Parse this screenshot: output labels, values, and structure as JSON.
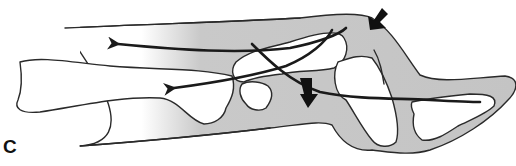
{
  "figure": {
    "panel_label": "C",
    "colors": {
      "tissue_fill": "#c8c8c8",
      "outline": "#2a2a2a",
      "arrow": "#1a1a1a",
      "background": "#ffffff"
    },
    "arrows": [
      {
        "name": "upper-leftward-force",
        "direction": "left"
      },
      {
        "name": "lower-leftward-force",
        "direction": "left"
      },
      {
        "name": "rightward-diagonal-force",
        "direction": "right-down"
      },
      {
        "name": "downward-block-arrow",
        "direction": "down"
      },
      {
        "name": "incoming-block-arrow",
        "direction": "down-left"
      }
    ]
  }
}
